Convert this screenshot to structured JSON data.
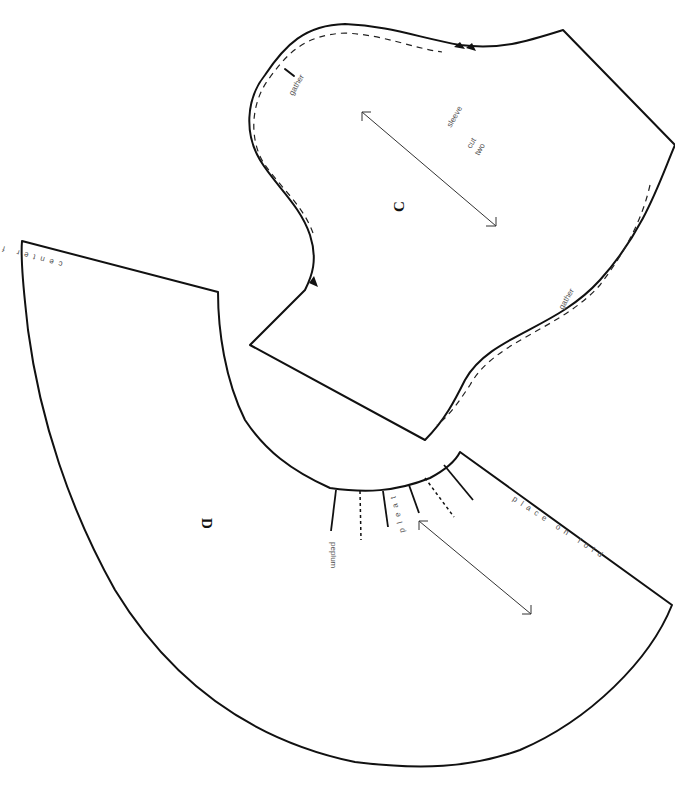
{
  "pattern": {
    "piece_c": {
      "letter": "C",
      "name": "sleeve",
      "cut_line1": "cut",
      "cut_line2": "two",
      "gather_top": "gather",
      "gather_bottom": "gather"
    },
    "piece_d": {
      "letter": "D",
      "name": "peplum",
      "edge_label_left": "center front",
      "edge_label_right": "place on fold",
      "pleat_label": "pleat"
    },
    "colors": {
      "line": "#111111",
      "text": "#555555",
      "background": "#ffffff"
    }
  }
}
